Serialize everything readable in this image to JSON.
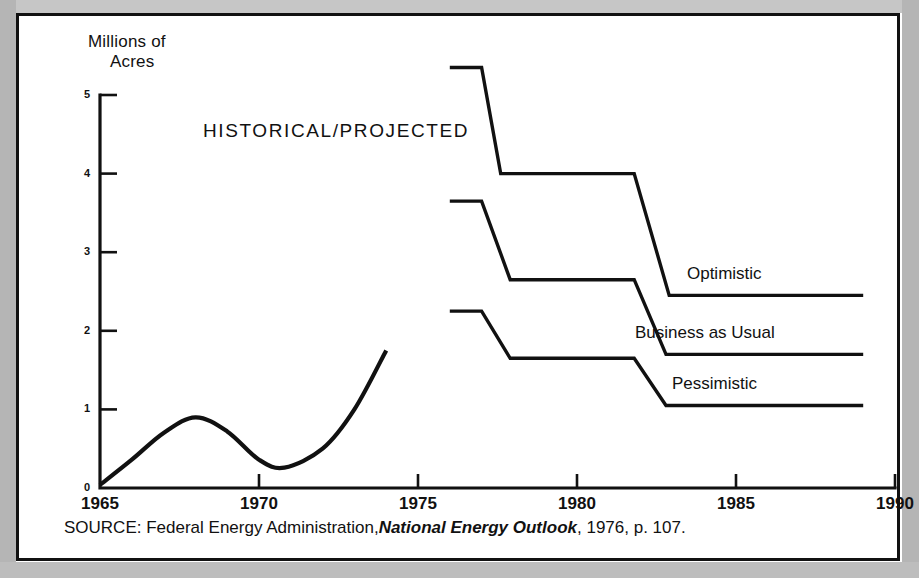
{
  "figure": {
    "y_axis_title_line1": "Millions of",
    "y_axis_title_line2": "Acres",
    "annotation": "HISTORICAL/PROJECTED",
    "source_prefix": "SOURCE:  Federal Energy Administration,",
    "source_italic": "National Energy Outlook",
    "source_suffix": ", 1976, p. 107."
  },
  "axes": {
    "y_ticks": [
      "5",
      "4",
      "3",
      "2",
      "1",
      "0"
    ],
    "x_ticks": [
      "1965",
      "1970",
      "1975",
      "1980",
      "1985",
      "1990"
    ]
  },
  "series_labels": {
    "optimistic": "Optimistic",
    "business": "Business as Usual",
    "pessimistic": "Pessimistic"
  },
  "colors": {
    "ink": "#111111",
    "paper": "#ffffff",
    "page_surround": "#b9b9b9"
  },
  "chart_data": {
    "type": "line",
    "title": "HISTORICAL/PROJECTED",
    "xlabel": "",
    "ylabel": "Millions of Acres",
    "xlim": [
      1965,
      1990
    ],
    "ylim": [
      0,
      5
    ],
    "grid": false,
    "legend": "inline-right-of-series",
    "xticks": [
      1965,
      1970,
      1975,
      1980,
      1985,
      1990
    ],
    "yticks": [
      0,
      1,
      2,
      3,
      4,
      5
    ],
    "series": [
      {
        "name": "Historical",
        "style": "smooth-curve",
        "x": [
          1965,
          1966,
          1967,
          1968,
          1969,
          1970,
          1970.8,
          1972,
          1973,
          1974
        ],
        "values": [
          0.04,
          0.36,
          0.7,
          0.9,
          0.72,
          0.36,
          0.26,
          0.5,
          1.0,
          1.75
        ]
      },
      {
        "name": "Optimistic",
        "style": "step",
        "x": [
          1976.0,
          1977.0,
          1977.6,
          1981.8,
          1982.9,
          1989.0
        ],
        "values": [
          5.35,
          5.35,
          4.0,
          4.0,
          2.45,
          2.45
        ]
      },
      {
        "name": "Business as Usual",
        "style": "step",
        "x": [
          1976.0,
          1977.0,
          1977.9,
          1981.8,
          1982.8,
          1989.0
        ],
        "values": [
          3.65,
          3.65,
          2.65,
          2.65,
          1.7,
          1.7
        ]
      },
      {
        "name": "Pessimistic",
        "style": "step",
        "x": [
          1976.0,
          1977.0,
          1977.9,
          1981.8,
          1982.8,
          1989.0
        ],
        "values": [
          2.25,
          2.25,
          1.65,
          1.65,
          1.05,
          1.05
        ]
      }
    ]
  }
}
